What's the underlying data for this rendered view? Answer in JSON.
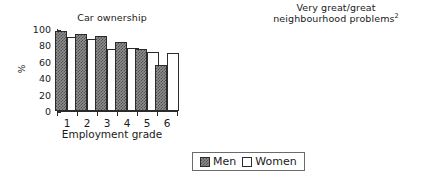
{
  "figure": {
    "legend": {
      "entries": [
        {
          "label": "Men",
          "swatch": "men-swatch",
          "color": "#8f8f8f"
        },
        {
          "label": "Women",
          "swatch": "women-swatch",
          "color": "#ffffff"
        }
      ]
    }
  },
  "chart_data": [
    {
      "type": "bar",
      "title": "Car ownership",
      "title_lines": [
        "Car ownership"
      ],
      "xlabel": "Employment grade",
      "ylabel": "%",
      "categories": [
        "1",
        "2",
        "3",
        "4",
        "5",
        "6"
      ],
      "ylim": [
        0,
        100
      ],
      "yticks": [
        0,
        20,
        40,
        60,
        80,
        100
      ],
      "ytick_labels": [
        "0",
        "20",
        "40",
        "60",
        "80",
        "100"
      ],
      "grid": false,
      "legend_position": "below-figure",
      "series": [
        {
          "name": "Men",
          "values": [
            98,
            94,
            92,
            84,
            76,
            56
          ]
        },
        {
          "name": "Women",
          "values": [
            90,
            88,
            76,
            77,
            72,
            71
          ]
        }
      ]
    },
    {
      "type": "bar",
      "title": "Very great/great neighbourhood problems2",
      "title_lines": [
        "Very great/great",
        "neighbourhood problems"
      ],
      "title_superscript": "2",
      "xlabel": "Employment grade",
      "ylabel": "%",
      "categories": [
        "1",
        "2",
        "3",
        "4",
        "5",
        "6"
      ],
      "ylim": [
        0,
        6
      ],
      "yticks": [
        0,
        1,
        2,
        3,
        4,
        5,
        6
      ],
      "ytick_labels": [
        "0",
        "1",
        "2",
        "3",
        "4",
        "5",
        "6"
      ],
      "grid": false,
      "legend_position": "below-figure",
      "series": [
        {
          "name": "Men",
          "values": [
            1.7,
            1.95,
            1.4,
            2.35,
            3.65,
            5.0
          ]
        },
        {
          "name": "Women",
          "values": [
            1.85,
            1.7,
            2.0,
            2.65,
            4.4,
            6.0
          ]
        }
      ]
    }
  ]
}
